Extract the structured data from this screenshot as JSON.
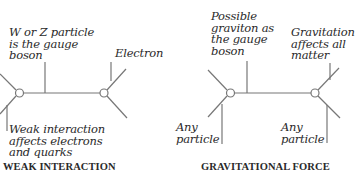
{
  "colors": {
    "line": "#777777",
    "text": "#2a2a2a",
    "background": "#ffffff"
  },
  "weak": {
    "caption": "WEAK INTERACTION",
    "boson_label": "W or Z particle\nis the gauge\nboson",
    "electron_label": "Electron",
    "interaction_label": "Weak interaction\naffects electrons\nand quarks"
  },
  "gravity": {
    "caption": "GRAVITATIONAL FORCE",
    "boson_label": "Possible\ngraviton as\nthe gauge\nboson",
    "matter_label": "Gravitation\naffects all\nmatter",
    "left_particle_label": "Any\nparticle",
    "right_particle_label": "Any\nparticle"
  }
}
